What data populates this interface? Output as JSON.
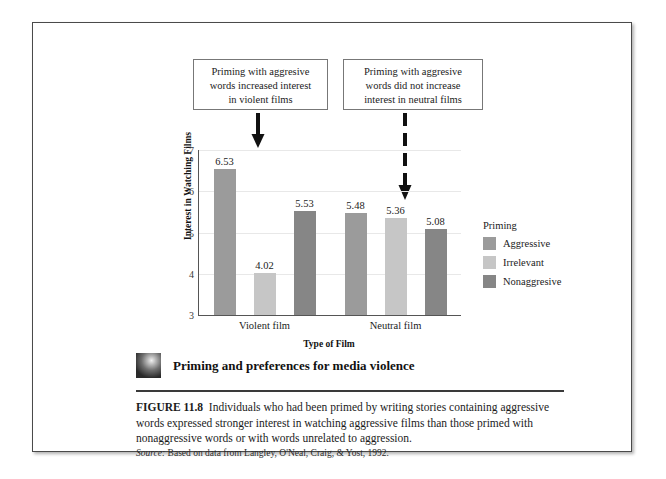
{
  "figure": {
    "callouts": [
      {
        "name": "violent",
        "lines": [
          "Priming with aggresive",
          "words increased interest",
          "in violent films"
        ],
        "arrow": "solid-down-arrow"
      },
      {
        "name": "neutral",
        "lines": [
          "Priming with aggresive",
          "words did not increase",
          "interest in neutral films"
        ],
        "arrow": "dashed-down-arrow"
      }
    ],
    "caption_title": "Priming and preferences for media violence",
    "caption_figure_number": "FIGURE 11.8",
    "caption_body": "Individuals who had been primed by writing stories containing aggressive words expressed stronger interest in watching aggressive films than those primed with nonaggressive words or with words unrelated to aggression.",
    "source_label": "Source:",
    "source_text": "Based on data from Langley, O'Neal, Craig, & Yost, 1992."
  },
  "legend": {
    "title": "Priming",
    "items": [
      {
        "label": "Aggressive",
        "color": "#9b9b9b"
      },
      {
        "label": "Irrelevant",
        "color": "#c6c6c6"
      },
      {
        "label": "Nonaggresive",
        "color": "#868686"
      }
    ]
  },
  "chart_data": {
    "type": "bar",
    "title": "",
    "xlabel": "Type of Film",
    "ylabel": "Interest in Watching Films",
    "categories": [
      "Violent film",
      "Neutral film"
    ],
    "ylim": [
      3,
      7
    ],
    "yticks": [
      3,
      4,
      5,
      6,
      7
    ],
    "ytick_labels": [
      "3",
      "4",
      "5",
      "6",
      "7"
    ],
    "grid": true,
    "legend_position": "right",
    "series": [
      {
        "name": "Aggressive",
        "color": "#9b9b9b",
        "values": [
          6.53,
          5.48
        ]
      },
      {
        "name": "Irrelevant",
        "color": "#c6c6c6",
        "values": [
          4.02,
          5.36
        ]
      },
      {
        "name": "Nonaggresive",
        "color": "#868686",
        "values": [
          5.53,
          5.08
        ]
      }
    ],
    "value_labels": [
      "6.53",
      "4.02",
      "5.53",
      "5.48",
      "5.36",
      "5.08"
    ]
  }
}
